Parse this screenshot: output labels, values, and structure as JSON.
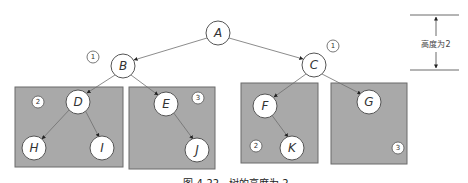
{
  "diagram": {
    "caption": "图 4-22　树的高度为 2",
    "height_annotation": {
      "label": "高度为2"
    },
    "nodes": [
      {
        "id": "A",
        "label": "A"
      },
      {
        "id": "B",
        "label": "B"
      },
      {
        "id": "C",
        "label": "C"
      },
      {
        "id": "D",
        "label": "D"
      },
      {
        "id": "E",
        "label": "E"
      },
      {
        "id": "F",
        "label": "F"
      },
      {
        "id": "G",
        "label": "G"
      },
      {
        "id": "H",
        "label": "H"
      },
      {
        "id": "I",
        "label": "I"
      },
      {
        "id": "J",
        "label": "J"
      },
      {
        "id": "K",
        "label": "K"
      }
    ],
    "edges": [
      [
        "A",
        "B"
      ],
      [
        "A",
        "C"
      ],
      [
        "B",
        "D"
      ],
      [
        "B",
        "E"
      ],
      [
        "C",
        "F"
      ],
      [
        "C",
        "G"
      ],
      [
        "D",
        "H"
      ],
      [
        "D",
        "I"
      ],
      [
        "E",
        "J"
      ],
      [
        "F",
        "K"
      ]
    ],
    "level_badges": [
      {
        "near": "B",
        "label": "1"
      },
      {
        "near": "C",
        "label": "1"
      },
      {
        "box": "D-subtree",
        "label": "2"
      },
      {
        "box": "E-subtree",
        "label": "3"
      },
      {
        "box": "F-subtree",
        "label": "2"
      },
      {
        "box": "G-subtree",
        "label": "3"
      }
    ],
    "subtree_boxes": [
      "D-subtree",
      "E-subtree",
      "F-subtree",
      "G-subtree"
    ],
    "colors": {
      "box_fill": "#a9a9a9",
      "node_fill": "#ffffff",
      "edge": "#6e6e6e"
    }
  }
}
